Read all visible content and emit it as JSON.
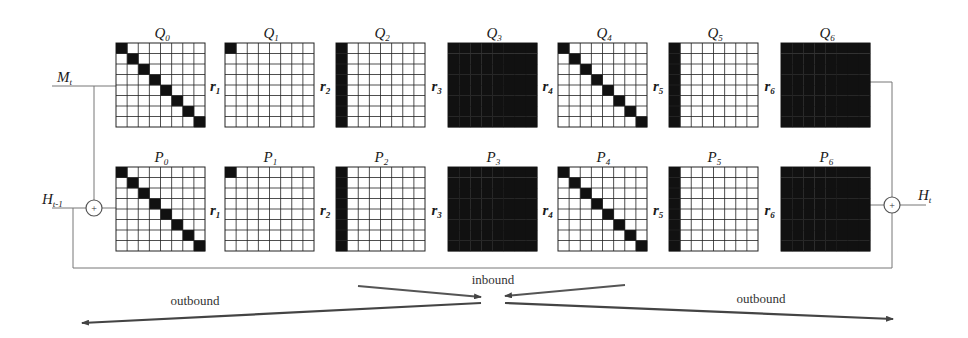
{
  "diagram": {
    "grid_size": 8,
    "colors": {
      "filled": "#111111",
      "empty": "#ffffff",
      "line": "#222222",
      "wire": "#777777",
      "arrow": "#444444"
    },
    "rows": [
      {
        "name": "Q",
        "y": 43,
        "matrices": [
          {
            "label": "Q",
            "sub": "0",
            "pattern": "diagonal"
          },
          {
            "label": "Q",
            "sub": "1",
            "pattern": "top-left"
          },
          {
            "label": "Q",
            "sub": "2",
            "pattern": "first-column"
          },
          {
            "label": "Q",
            "sub": "3",
            "pattern": "full"
          },
          {
            "label": "Q",
            "sub": "4",
            "pattern": "diagonal"
          },
          {
            "label": "Q",
            "sub": "5",
            "pattern": "first-column"
          },
          {
            "label": "Q",
            "sub": "6",
            "pattern": "full"
          }
        ]
      },
      {
        "name": "P",
        "y": 167,
        "matrices": [
          {
            "label": "P",
            "sub": "0",
            "pattern": "diagonal"
          },
          {
            "label": "P",
            "sub": "1",
            "pattern": "top-left"
          },
          {
            "label": "P",
            "sub": "2",
            "pattern": "first-column"
          },
          {
            "label": "P",
            "sub": "3",
            "pattern": "full"
          },
          {
            "label": "P",
            "sub": "4",
            "pattern": "diagonal"
          },
          {
            "label": "P",
            "sub": "5",
            "pattern": "first-column"
          },
          {
            "label": "P",
            "sub": "6",
            "pattern": "full"
          }
        ]
      }
    ],
    "rotations": [
      {
        "label": "r",
        "sub": "1"
      },
      {
        "label": "r",
        "sub": "2"
      },
      {
        "label": "r",
        "sub": "3"
      },
      {
        "label": "r",
        "sub": "4"
      },
      {
        "label": "r",
        "sub": "5"
      },
      {
        "label": "r",
        "sub": "6"
      }
    ],
    "inputs": {
      "m": {
        "label": "M",
        "sub": "t"
      },
      "h_prev": {
        "label": "H",
        "sub": "t-1"
      },
      "h_out": {
        "label": "H",
        "sub": "t"
      }
    },
    "adder_symbol": "+",
    "flow": {
      "inbound": "inbound",
      "outbound_left": "outbound",
      "outbound_right": "outbound"
    }
  }
}
